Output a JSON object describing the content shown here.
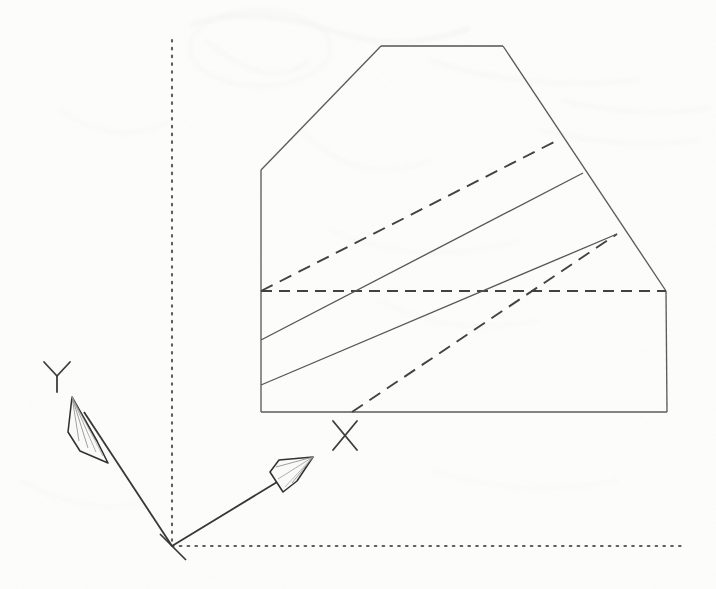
{
  "document": {
    "kind": "scanned-engineering-drawing",
    "title": "Isometric solid with inclined layered planes",
    "background_color": "#fdfdfc",
    "ink_color": "#4a4a4a",
    "ink_color_dark": "#2e2e2e",
    "width": 716,
    "height": 589
  },
  "axes": {
    "origin": {
      "x": 172,
      "y": 546
    },
    "y_axis": {
      "label": "Y",
      "label_x": 56,
      "label_y": 375,
      "line": {
        "x1": 172,
        "y1": 546,
        "x2": 80,
        "y2": 406
      },
      "arrow_tip": {
        "x": 73,
        "y": 398
      }
    },
    "x_axis": {
      "label": "X",
      "label_x": 345,
      "label_y": 436,
      "line": {
        "x1": 172,
        "y1": 546,
        "x2": 302,
        "y2": 466
      },
      "arrow_tip": {
        "x": 310,
        "y": 461
      }
    },
    "reference_lines": {
      "vertical_dotted": {
        "x": 172,
        "y_top": 40,
        "y_bottom": 546
      },
      "horizontal_dotted": {
        "y": 546,
        "x_left": 172,
        "x_right": 684
      }
    }
  },
  "solid": {
    "name": "layered-prism-outline",
    "outline_points": "381,46 503,46 665,290 667,412 261,412 261,170",
    "edges": [
      {
        "name": "top-edge",
        "style": "solid",
        "from": [
          381,
          46
        ],
        "to": [
          503,
          46
        ]
      },
      {
        "name": "upper-left-bevel",
        "style": "solid",
        "from": [
          381,
          46
        ],
        "to": [
          261,
          170
        ]
      },
      {
        "name": "left-vertical-edge",
        "style": "solid",
        "from": [
          261,
          170
        ],
        "to": [
          261,
          412
        ]
      },
      {
        "name": "bottom-edge",
        "style": "solid",
        "from": [
          261,
          412
        ],
        "to": [
          667,
          412
        ]
      },
      {
        "name": "right-vertical-edge",
        "style": "solid",
        "from": [
          667,
          412
        ],
        "to": [
          666,
          291
        ]
      },
      {
        "name": "upper-right-bevel",
        "style": "solid",
        "from": [
          503,
          46
        ],
        "to": [
          666,
          291
        ]
      }
    ],
    "hidden_edges": [
      {
        "name": "horizontal-hidden-edge",
        "style": "dashed",
        "from": [
          261,
          291
        ],
        "to": [
          666,
          291
        ]
      },
      {
        "name": "hidden-layer-line-upper",
        "style": "dashed",
        "from": [
          261,
          291
        ],
        "to": [
          558,
          140
        ]
      },
      {
        "name": "hidden-layer-line-lower",
        "style": "dashed",
        "from": [
          352,
          412
        ],
        "to": [
          617,
          234
        ]
      }
    ],
    "layer_lines": [
      {
        "name": "layer-line-1",
        "style": "solid",
        "from": [
          261,
          340
        ],
        "to": [
          583,
          173
        ]
      },
      {
        "name": "layer-line-2",
        "style": "solid",
        "from": [
          261,
          385
        ],
        "to": [
          617,
          234
        ]
      }
    ]
  },
  "labels": {
    "y_axis_label": "Y",
    "x_axis_label": "X"
  }
}
